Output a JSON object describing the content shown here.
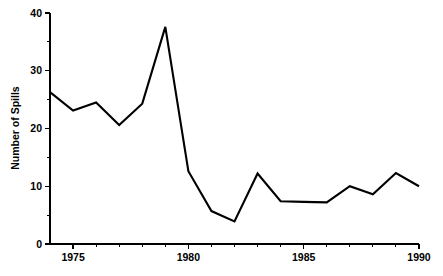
{
  "chart_data": {
    "type": "line",
    "title": "",
    "xlabel": "",
    "ylabel": "Number of Spills",
    "x": [
      1974,
      1975,
      1976,
      1977,
      1978,
      1979,
      1980,
      1981,
      1982,
      1983,
      1984,
      1985,
      1986,
      1987,
      1988,
      1989,
      1990
    ],
    "values": [
      26.3,
      23.1,
      24.5,
      20.6,
      24.3,
      37.6,
      12.6,
      5.7,
      3.9,
      12.2,
      7.4,
      7.3,
      7.2,
      10.0,
      8.6,
      12.3,
      10.0
    ],
    "series": [
      {
        "name": "Number of Spills",
        "values": [
          26.3,
          23.1,
          24.5,
          20.6,
          24.3,
          37.6,
          12.6,
          5.7,
          3.9,
          12.2,
          7.4,
          7.3,
          7.2,
          10.0,
          8.6,
          12.3,
          10.0
        ]
      }
    ],
    "xlim": [
      1974,
      1990
    ],
    "ylim": [
      0,
      40
    ],
    "y_ticks_major": [
      0,
      10,
      20,
      30,
      40
    ],
    "y_tick_labels": [
      "0",
      "10",
      "20",
      "30",
      "40"
    ],
    "y_ticks_minor": [
      5,
      15,
      25,
      35
    ],
    "x_ticks_major": [
      1975,
      1980,
      1985,
      1990
    ],
    "x_tick_labels": [
      "1975",
      "1980",
      "1985",
      "1990"
    ],
    "x_ticks_minor": [
      1976,
      1977,
      1978,
      1979,
      1981,
      1982,
      1983,
      1984,
      1986,
      1987,
      1988,
      1989
    ],
    "grid": false,
    "legend": "none",
    "line_color": "#000000",
    "background_color": "#ffffff"
  },
  "axes": {
    "y_axis_title": "Number of Spills"
  }
}
